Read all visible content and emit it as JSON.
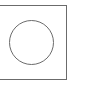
{
  "diagram": {
    "shapes": [
      {
        "type": "rectangle",
        "stroke": "#6b6b6b",
        "fill": "#ffffff"
      },
      {
        "type": "circle",
        "stroke": "#6b6b6b",
        "fill": "#ffffff"
      }
    ]
  }
}
